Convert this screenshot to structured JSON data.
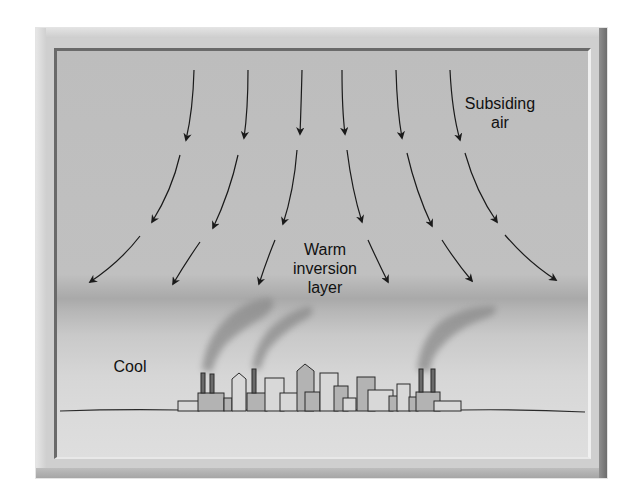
{
  "diagram": {
    "type": "temperature-inversion",
    "labels": {
      "subsiding_air_line1": "Subsiding",
      "subsiding_air_line2": "air",
      "warm_line1": "Warm",
      "warm_line2": "inversion",
      "warm_line3": "layer",
      "cool": "Cool"
    },
    "colors": {
      "sky_upper": "#bdbdbd",
      "inversion_band": "#a9a9a9",
      "lower_air": "#d6d6d6",
      "arrow": "#1a1a1a",
      "building_fill_light": "#d8d8d8",
      "building_fill_dark": "#b3b3b3",
      "smoke": "#8a8a8a"
    },
    "arrow_rows": 3,
    "arrows_per_row": 6
  }
}
